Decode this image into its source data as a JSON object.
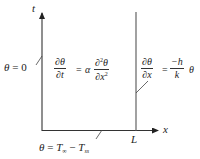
{
  "diagram": {
    "type": "boundary-value-problem-domain",
    "axes": {
      "vertical_label": "t",
      "horizontal_label": "x",
      "length_marker": "L"
    },
    "boundary_conditions": {
      "left": {
        "lhs": "θ",
        "eq": "=",
        "rhs": "0"
      },
      "bottom": {
        "lhs": "θ",
        "eq": "=",
        "T1": "T",
        "T1_sub": "∞",
        "minus": "−",
        "T2": "T",
        "T2_sub": "ss"
      },
      "right": {
        "num": "∂θ",
        "den": "∂x",
        "eq": "=",
        "rhs_num": "−h",
        "rhs_den": "k",
        "rhs_tail": "θ"
      }
    },
    "governing_equation": {
      "lhs_num": "∂θ",
      "lhs_den": "∂t",
      "eq": "=",
      "coef": "α",
      "rhs_num_prefix": "∂",
      "rhs_num_sup": "2",
      "rhs_num_suffix": "θ",
      "rhs_den_prefix": "∂x",
      "rhs_den_sup": "2"
    },
    "colors": {
      "line": "#333333",
      "text": "#222222",
      "background": "#ffffff"
    }
  }
}
